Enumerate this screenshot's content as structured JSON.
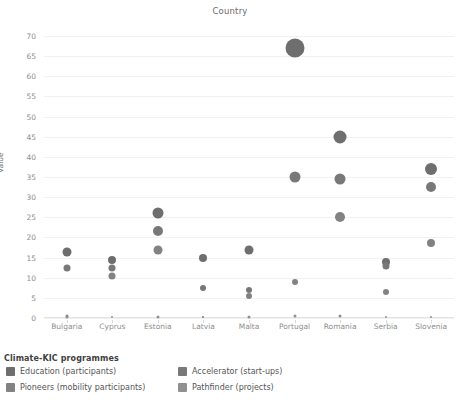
{
  "chart_data": {
    "type": "scatter",
    "title": "Country",
    "xlabel": "",
    "ylabel": "Value",
    "ylim": [
      0,
      72
    ],
    "yticks": [
      0,
      5,
      10,
      15,
      20,
      25,
      30,
      35,
      40,
      45,
      50,
      55,
      60,
      65,
      70
    ],
    "grid": true,
    "legend_position": "bottom-left",
    "legend_title": "Climate-KIC programmes",
    "categories": [
      "Bulgaria",
      "Cyprus",
      "Estonia",
      "Latvia",
      "Malta",
      "Portugal",
      "Romania",
      "Serbia",
      "Slovenia"
    ],
    "series": [
      {
        "name": "Education (participants)",
        "color": "#6e6e6e",
        "values": [
          16.5,
          14.5,
          26.0,
          15.0,
          17.0,
          67.0,
          45.0,
          14.0,
          37.0
        ],
        "sizes": [
          9,
          8,
          11,
          8,
          9,
          19,
          13,
          8,
          12
        ]
      },
      {
        "name": "Accelerator (start-ups)",
        "color": "#787878",
        "values": [
          12.5,
          12.5,
          21.5,
          7.5,
          7.0,
          35.0,
          34.5,
          13.0,
          32.5
        ],
        "sizes": [
          7,
          7,
          10,
          6,
          6,
          11,
          11,
          7,
          10
        ]
      },
      {
        "name": "Pioneers (mobility participants)",
        "color": "#828282",
        "values": [
          0.4,
          10.5,
          17.0,
          0.3,
          5.5,
          9.0,
          25.0,
          6.5,
          18.5
        ],
        "sizes": [
          3,
          7,
          9,
          2,
          6,
          6,
          10,
          6,
          8
        ]
      },
      {
        "name": "Pathfinder (projects)",
        "color": "#909090",
        "values": [
          0.3,
          0.3,
          0.3,
          0.3,
          0.3,
          0.4,
          0.4,
          0.3,
          0.3
        ],
        "sizes": [
          3,
          2,
          3,
          2,
          3,
          3,
          3,
          2,
          2
        ]
      }
    ]
  },
  "legend": {
    "title": "Climate-KIC programmes",
    "items": [
      {
        "label": "Education (participants)",
        "color": "#6e6e6e"
      },
      {
        "label": "Accelerator (start-ups)",
        "color": "#787878"
      },
      {
        "label": "Pioneers (mobility participants)",
        "color": "#828282"
      },
      {
        "label": "Pathfinder (projects)",
        "color": "#909090"
      }
    ]
  }
}
